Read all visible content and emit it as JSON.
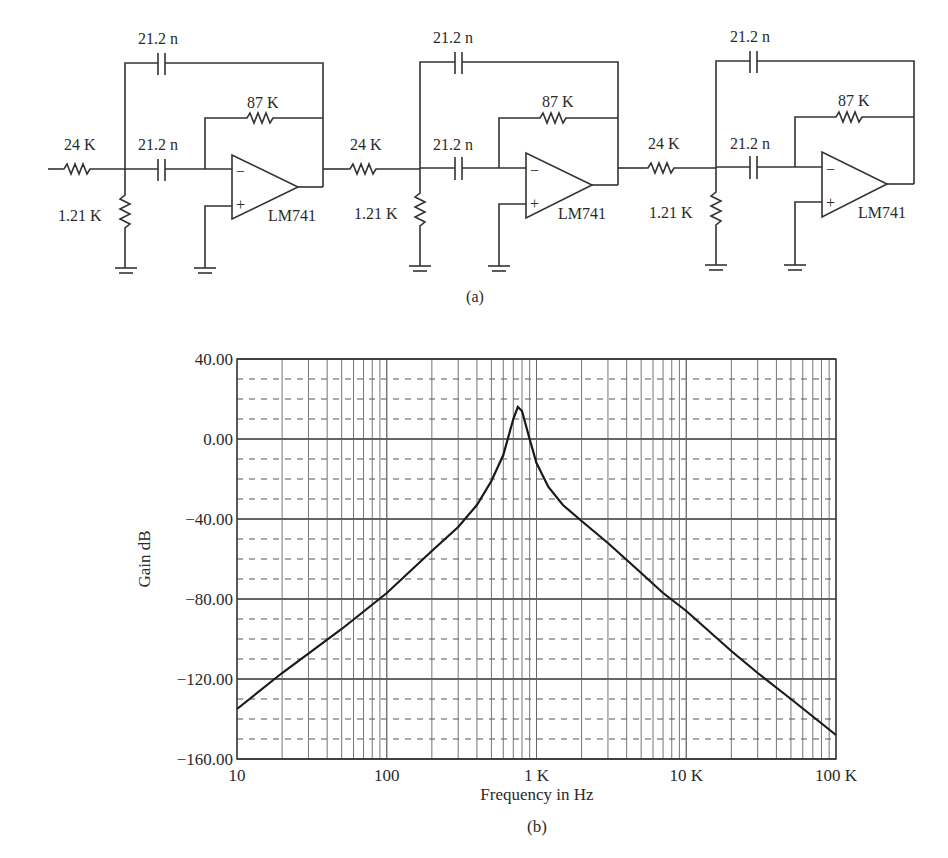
{
  "figure": {
    "panel_a_caption": "(a)",
    "panel_b_caption": "(b)"
  },
  "circuit": {
    "stages": [
      {
        "input_resistor": "24 K",
        "ground_resistor": "1.21 K",
        "feedback_capacitor": "21.2 n",
        "series_capacitor": "21.2 n",
        "feedback_resistor": "87 K",
        "opamp": "LM741",
        "opamp_minus": "−",
        "opamp_plus": "+"
      },
      {
        "input_resistor": "24 K",
        "ground_resistor": "1.21 K",
        "feedback_capacitor": "21.2 n",
        "series_capacitor": "21.2 n",
        "feedback_resistor": "87 K",
        "opamp": "LM741",
        "opamp_minus": "−",
        "opamp_plus": "+"
      },
      {
        "input_resistor": "24 K",
        "ground_resistor": "1.21 K",
        "feedback_capacitor": "21.2 n",
        "series_capacitor": "21.2 n",
        "feedback_resistor": "87 K",
        "opamp": "LM741",
        "opamp_minus": "−",
        "opamp_plus": "+"
      }
    ]
  },
  "chart_data": {
    "type": "line",
    "title": "",
    "xlabel": "Frequency in Hz",
    "ylabel": "Gain dB",
    "xscale": "log",
    "xlim": [
      10,
      100000
    ],
    "ylim": [
      -160,
      40
    ],
    "x_tick_labels": [
      "10",
      "100",
      "1 K",
      "10 K",
      "100 K"
    ],
    "y_tick_labels": [
      "40.00",
      "0.00",
      "−40.00",
      "−80.00",
      "−120.00",
      "−160.00"
    ],
    "y_major_step": 40,
    "y_minor_step": 10,
    "grid": {
      "major_y": "solid",
      "minor_y": "dashed",
      "x": "log decades with minor lines"
    },
    "series": [
      {
        "name": "Gain",
        "x": [
          10,
          20,
          50,
          100,
          200,
          300,
          400,
          500,
          600,
          700,
          750,
          800,
          900,
          1000,
          1200,
          1500,
          2000,
          3000,
          5000,
          7000,
          10000,
          20000,
          30000,
          50000,
          100000
        ],
        "values": [
          -135,
          -117,
          -95,
          -77,
          -56,
          -44,
          -33,
          -21,
          -8,
          10,
          16,
          14,
          0,
          -12,
          -24,
          -33,
          -41,
          -52,
          -67,
          -77,
          -86,
          -106,
          -117,
          -130,
          -148
        ]
      }
    ],
    "peak": {
      "x": 750,
      "y": 16
    }
  }
}
